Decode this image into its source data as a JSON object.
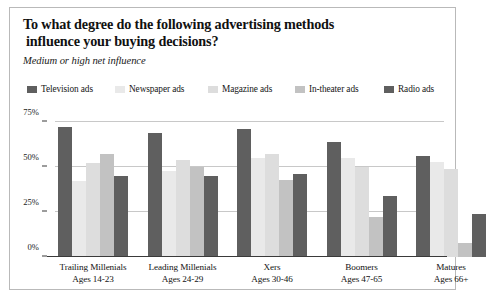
{
  "card": {
    "title_line1": "To what degree do the following advertising methods",
    "title_line2": "influence your buying decisions?",
    "subtitle": "Medium or high net influence"
  },
  "legend": {
    "items": [
      {
        "label": "Television ads",
        "color": "#5f5f5f",
        "left": 0
      },
      {
        "label": "Newspaper ads",
        "color": "#e9e9e9",
        "left": 88
      },
      {
        "label": "Magazine ads",
        "color": "#dddddd",
        "left": 181
      },
      {
        "label": "In-theater ads",
        "color": "#c2c2c2",
        "left": 268
      },
      {
        "label": "Radio ads",
        "color": "#5f5f5f",
        "left": 357
      }
    ]
  },
  "chart_data": {
    "type": "bar",
    "title": "To what degree do the following advertising methods influence your buying decisions?",
    "subtitle": "Medium or high net influence",
    "xlabel": "",
    "ylabel": "",
    "ylim": [
      0,
      80
    ],
    "grid": true,
    "legend_position": "top",
    "ticks": [
      {
        "label": "0%",
        "value": 0
      },
      {
        "label": "25%",
        "value": 25
      },
      {
        "label": "50%",
        "value": 50
      },
      {
        "label": "75%",
        "value": 75
      }
    ],
    "categories": [
      "Trailing Millenials",
      "Leading Millenials",
      "Xers",
      "Boomers",
      "Matures"
    ],
    "category_sublabels": [
      "Ages 14-23",
      "Ages 24-29",
      "Ages 30-46",
      "Ages 47-65",
      "Ages 66+"
    ],
    "series": [
      {
        "name": "Television ads",
        "color": "#5f5f5f",
        "values": [
          72,
          69,
          71,
          64,
          56
        ]
      },
      {
        "name": "Newspaper ads",
        "color": "#e9e9e9",
        "values": [
          42,
          48,
          55,
          55,
          53
        ]
      },
      {
        "name": "Magazine ads",
        "color": "#dddddd",
        "values": [
          52,
          54,
          57,
          50,
          49
        ]
      },
      {
        "name": "In-theater ads",
        "color": "#c2c2c2",
        "values": [
          57,
          50,
          43,
          22,
          8
        ]
      },
      {
        "name": "Radio ads",
        "color": "#5f5f5f",
        "values": [
          45,
          45,
          46,
          34,
          24
        ]
      }
    ]
  }
}
